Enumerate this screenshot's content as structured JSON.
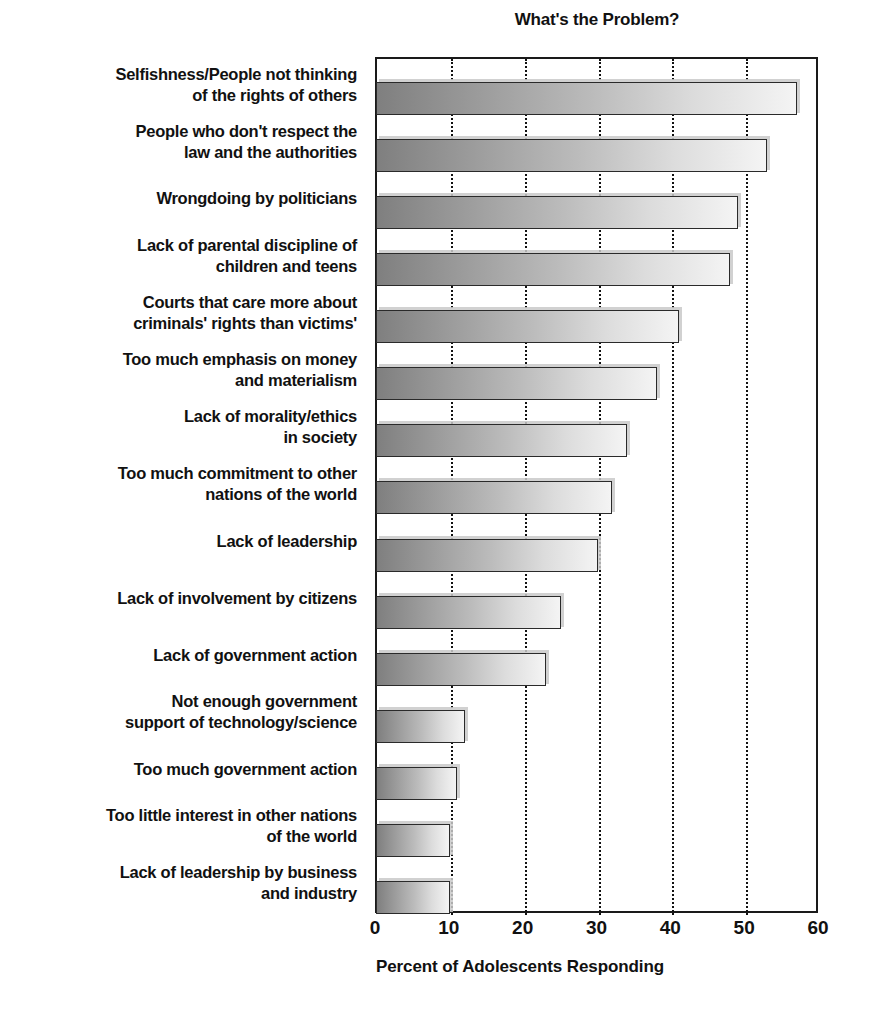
{
  "chart_data": {
    "type": "bar",
    "orientation": "horizontal",
    "title": "What's the Problem?",
    "xlabel": "Percent of Adolescents Responding",
    "ylabel": "",
    "xlim": [
      0,
      60
    ],
    "xticks": [
      0,
      10,
      20,
      30,
      40,
      50,
      60
    ],
    "grid": "vertical dotted gridlines at each x tick",
    "legend": "none",
    "categories": [
      "Selfishness/People not thinking\nof the rights of others",
      "People who don't respect the\nlaw and the authorities",
      "Wrongdoing by politicians",
      "Lack of parental discipline of\nchildren and teens",
      "Courts that care more about\ncriminals' rights than victims'",
      "Too much emphasis on money\nand materialism",
      "Lack of morality/ethics\nin society",
      "Too much commitment to other\nnations of the world",
      "Lack of leadership",
      "Lack of involvement by citizens",
      "Lack of government action",
      "Not enough government\nsupport of technology/science",
      "Too much government action",
      "Too little interest in other nations\nof the world",
      "Lack of leadership by business\nand industry"
    ],
    "values": [
      57,
      53,
      49,
      48,
      41,
      38,
      34,
      32,
      30,
      25,
      23,
      12,
      11,
      10,
      10
    ],
    "bar_style": {
      "fill": "horizontal gradient dark-gray to light-gray",
      "gradient_start": "#7f7f7f",
      "gradient_end": "#f4f4f4",
      "border": "#2a2a2a",
      "shadow": "#c9c9c9"
    }
  },
  "axis": {
    "tick_labels": [
      "0",
      "10",
      "20",
      "30",
      "40",
      "50",
      "60"
    ]
  }
}
